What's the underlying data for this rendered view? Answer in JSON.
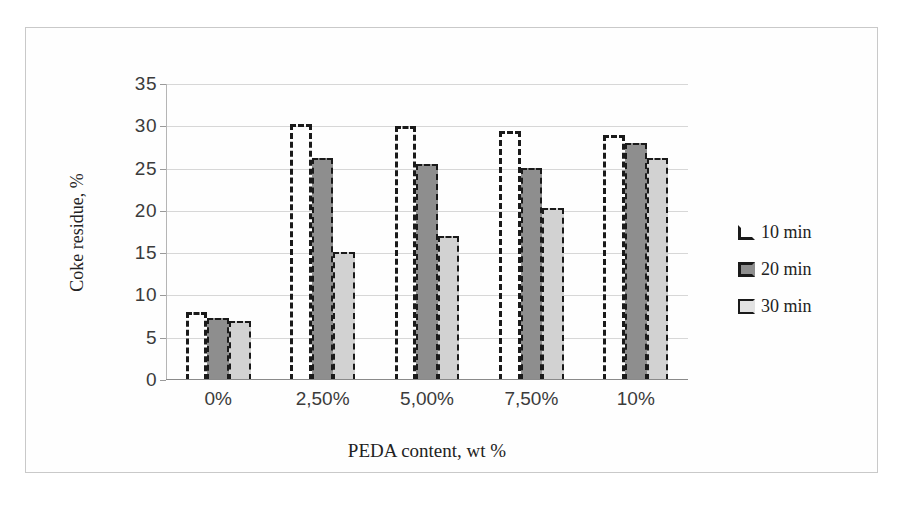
{
  "chart_data": {
    "type": "bar",
    "title": "",
    "xlabel": "PEDA content, wt %",
    "ylabel": "Coke residue, %",
    "categories": [
      "0%",
      "2,50%",
      "5,00%",
      "7,50%",
      "10%"
    ],
    "series": [
      {
        "name": "10 min",
        "values": [
          8.0,
          30.3,
          30.0,
          29.5,
          29.0
        ],
        "color": "#ffffff",
        "edge": "#1a1a1a",
        "style": "dashed-outline"
      },
      {
        "name": "20 min",
        "values": [
          7.3,
          26.2,
          25.5,
          25.1,
          28.0
        ],
        "color": "#8e8e8e",
        "edge": "#1a1a1a",
        "style": "dark-gray"
      },
      {
        "name": "30 min",
        "values": [
          7.0,
          15.1,
          17.0,
          20.3,
          26.2
        ],
        "color": "#d2d2d2",
        "edge": "#1a1a1a",
        "style": "light-gray"
      }
    ],
    "ylim": [
      0,
      35
    ],
    "yticks": [
      0,
      5,
      10,
      15,
      20,
      25,
      30,
      35
    ],
    "ytick_labels": [
      "0",
      "5",
      "10",
      "15",
      "20",
      "25",
      "30",
      "35"
    ],
    "grid": true,
    "legend_position": "right",
    "legend_entries": [
      "10 min",
      "20 min",
      "30 min"
    ],
    "frame": true,
    "background": "#ffffff"
  }
}
